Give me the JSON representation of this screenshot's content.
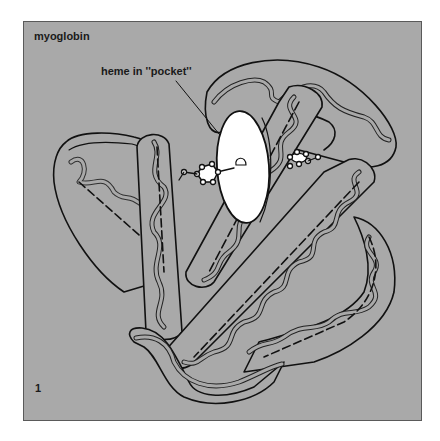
{
  "figure": {
    "title": "myoglobin",
    "annotation": "heme in ''pocket''",
    "number": "1"
  },
  "colors": {
    "background": "#a9a9a9",
    "outline": "#111111",
    "heme_disc": "#ffffff",
    "page": "#ffffff"
  },
  "elements": {
    "helices": [
      "helix-A",
      "helix-B",
      "helix-C",
      "helix-E",
      "helix-F",
      "helix-G",
      "helix-H"
    ],
    "heme": "heme-disc",
    "ligands": [
      "histidine-proximal",
      "histidine-distal"
    ]
  }
}
